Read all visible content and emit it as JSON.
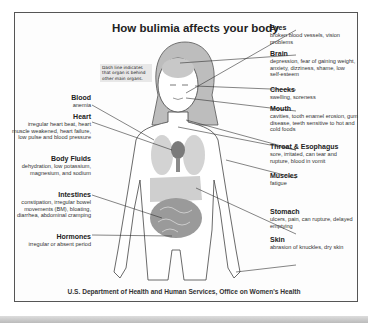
{
  "title": "How bulimia affects your body",
  "note": "Dash line indicates that organ is behind other main organs.",
  "left_labels": [
    {
      "heading": "Blood",
      "detail": "anemia"
    },
    {
      "heading": "Heart",
      "detail": "irregular heart beat, heart muscle weakened, heart failure, low pulse and blood pressure"
    },
    {
      "heading": "Body Fluids",
      "detail": "dehydration, low potassium, magnesium, and sodium"
    },
    {
      "heading": "Intestines",
      "detail": "constipation, irregular bowel movements (BM), bloating, diarrhea, abdominal cramping"
    },
    {
      "heading": "Hormones",
      "detail": "irregular or absent period"
    }
  ],
  "right_labels": [
    {
      "heading": "Eyes",
      "detail": "broken blood vessels, vision problems"
    },
    {
      "heading": "Brain",
      "detail": "depression, fear of gaining weight, anxiety, dizziness, shame, low self-esteem"
    },
    {
      "heading": "Cheeks",
      "detail": "swelling, soreness"
    },
    {
      "heading": "Mouth",
      "detail": "cavities, tooth enamel erosion, gum disease, teeth sensitive to hot and cold foods"
    },
    {
      "heading": "Throat & Esophagus",
      "detail": "sore, irritated, can tear and rupture, blood in vomit"
    },
    {
      "heading": "Muscles",
      "detail": "fatigue"
    },
    {
      "heading": "Stomach",
      "detail": "ulcers, pain, can rupture, delayed emptying"
    },
    {
      "heading": "Skin",
      "detail": "abrasion of knuckles, dry skin"
    }
  ],
  "footer": "U.S. Department of Health and Human Services, Office on Women's Health"
}
